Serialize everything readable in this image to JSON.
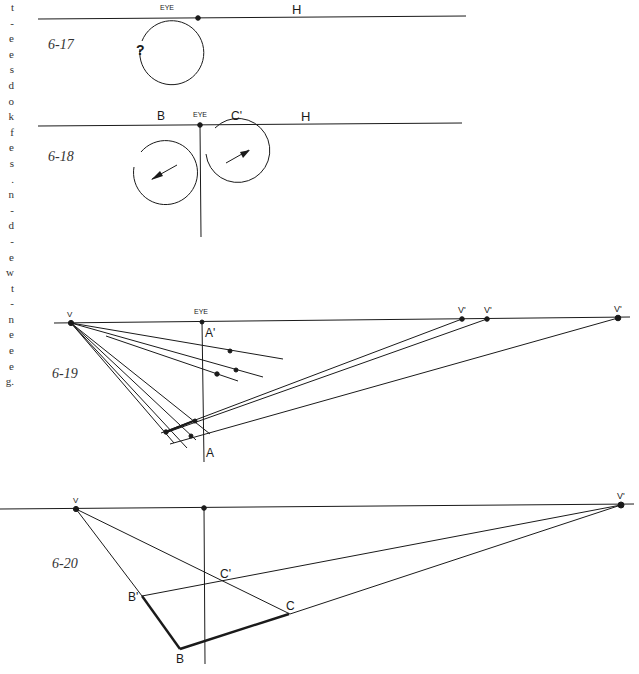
{
  "margin_text": {
    "fragments": [
      "t",
      "-",
      "e",
      "e",
      "s",
      "d",
      "o",
      "k",
      "f",
      "e",
      "s",
      ".",
      "n",
      "-",
      "d",
      "-",
      "e",
      "w",
      "t",
      "-",
      "n",
      "e",
      "e",
      "e",
      "g."
    ]
  },
  "figures": {
    "fig_6_17": {
      "label": "6-17",
      "eye_label": "EYE",
      "horizon_label": "H",
      "circle_label": "?"
    },
    "fig_6_18": {
      "label": "6-18",
      "eye_label": "EYE",
      "horizon_label": "H",
      "left_label": "B",
      "right_label": "C'"
    },
    "fig_6_19": {
      "label": "6-19",
      "eye_label": "EYE",
      "v_label": "V",
      "v_prime_labels": [
        "V'",
        "V'",
        "V'"
      ],
      "top_point_label": "A'",
      "bottom_point_label": "A"
    },
    "fig_6_20": {
      "label": "6-20",
      "v_label": "V",
      "v_prime_label": "V'",
      "points": {
        "b_prime": "B'",
        "b": "B",
        "c_prime": "C'",
        "c": "C"
      }
    }
  },
  "colors": {
    "ink": "#1a1a1a",
    "paper": "#ffffff"
  }
}
